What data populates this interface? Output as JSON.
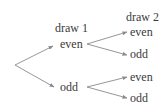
{
  "diagram": {
    "type": "probability-tree",
    "headers": {
      "draw1": "draw 1",
      "draw2": "draw 2"
    },
    "level1": [
      {
        "label": "even"
      },
      {
        "label": "odd"
      }
    ],
    "level2": [
      {
        "parent": "even",
        "label": "even"
      },
      {
        "parent": "even",
        "label": "odd"
      },
      {
        "parent": "odd",
        "label": "even"
      },
      {
        "parent": "odd",
        "label": "odd"
      }
    ],
    "colors": {
      "line": "#8a8a8a",
      "text": "#3a3a3a",
      "background": "#ffffff"
    }
  }
}
